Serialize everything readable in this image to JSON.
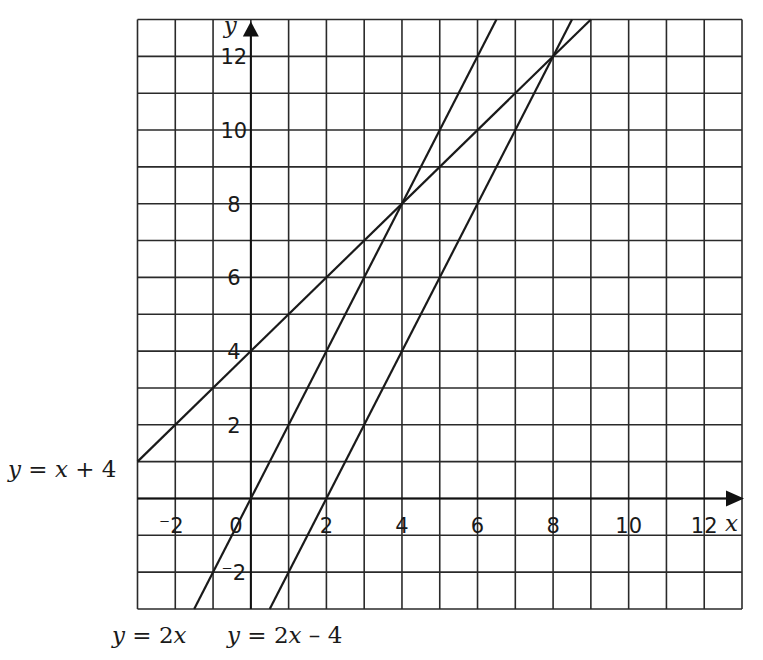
{
  "chart_data": {
    "type": "line",
    "title": "",
    "xlabel": "x",
    "ylabel": "y",
    "xlim": [
      -3,
      13
    ],
    "ylim": [
      -3,
      13
    ],
    "grid": true,
    "grid_step": 1,
    "x_ticks": [
      {
        "value": -2,
        "label": "⁻2"
      },
      {
        "value": 0,
        "label": "0"
      },
      {
        "value": 2,
        "label": "2"
      },
      {
        "value": 4,
        "label": "4"
      },
      {
        "value": 6,
        "label": "6"
      },
      {
        "value": 8,
        "label": "8"
      },
      {
        "value": 10,
        "label": "10"
      },
      {
        "value": 12,
        "label": "12"
      }
    ],
    "y_ticks": [
      {
        "value": -2,
        "label": "⁻2"
      },
      {
        "value": 2,
        "label": "2"
      },
      {
        "value": 4,
        "label": "4"
      },
      {
        "value": 6,
        "label": "6"
      },
      {
        "value": 8,
        "label": "8"
      },
      {
        "value": 10,
        "label": "10"
      },
      {
        "value": 12,
        "label": "12"
      }
    ],
    "series": [
      {
        "name": "y = x + 4",
        "slope": 1,
        "intercept": 4,
        "x": [
          -3,
          9
        ],
        "y": [
          1,
          13
        ],
        "label_position": "left"
      },
      {
        "name": "y = 2x",
        "slope": 2,
        "intercept": 0,
        "x": [
          -1.5,
          6.5
        ],
        "y": [
          -3,
          13
        ],
        "label_position": "bottom"
      },
      {
        "name": "y = 2x – 4",
        "slope": 2,
        "intercept": -4,
        "x": [
          0.5,
          8.5
        ],
        "y": [
          -3,
          13
        ],
        "label_position": "bottom"
      }
    ],
    "labels": {
      "x_axis": "x",
      "y_axis": "y",
      "line_a": {
        "prefix": "y",
        "eq": " = ",
        "var": "x",
        "rest": " + 4"
      },
      "line_b": {
        "prefix": "y",
        "eq": " = 2",
        "var": "x",
        "rest": ""
      },
      "line_c": {
        "prefix": "y",
        "eq": " = 2",
        "var": "x",
        "rest": " – 4"
      }
    }
  }
}
